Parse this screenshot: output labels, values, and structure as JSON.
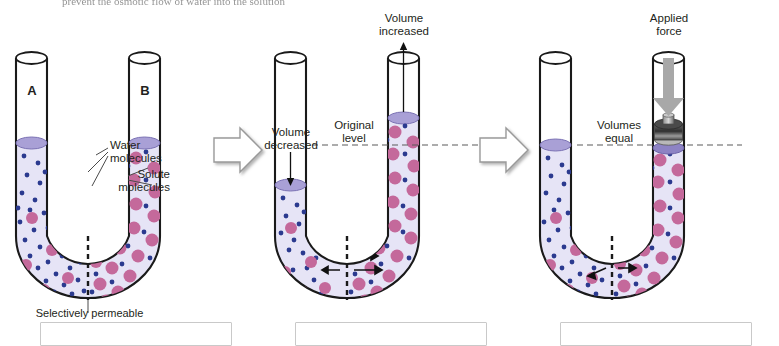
{
  "figure": {
    "clipped_header_text": "prevent the osmotic flow of water into the solution",
    "colors": {
      "fluid": "#e6e4f6",
      "surface": "#a9a0d6",
      "surface_dark": "#8d83c4",
      "solute": "#c4699b",
      "water": "#2b3a8f",
      "glass_outline": "#1a1a1a",
      "block_arrow_fill": "#ffffff",
      "block_arrow_stroke": "#9a9a9a",
      "weight_dark": "#3a3a3a",
      "weight_light": "#b8b8b8",
      "force_arrow": "#9c9c9c",
      "dash_line": "#5a5a5a"
    }
  },
  "panels": [
    {
      "id": "panel-initial",
      "tube_left_label": "A",
      "tube_right_label": "B",
      "annotations": [
        {
          "name": "water-molecules-label",
          "text": "Water\nmolecules"
        },
        {
          "name": "solute-molecules-label",
          "text": "Solute\nmolecules"
        },
        {
          "name": "membrane-label",
          "text": "Selectively permeable membrane"
        }
      ]
    },
    {
      "id": "panel-osmosis",
      "annotations": [
        {
          "name": "volume-decreased-label",
          "text": "Volume\ndecreased"
        },
        {
          "name": "original-level-label",
          "text": "Original\nlevel"
        },
        {
          "name": "volume-increased-label",
          "text": "Volume\nincreased"
        }
      ]
    },
    {
      "id": "panel-equilibrium",
      "annotations": [
        {
          "name": "volumes-equal-label",
          "text": "Volumes\nequal"
        },
        {
          "name": "applied-force-label",
          "text": "Applied\nforce"
        }
      ]
    }
  ],
  "captions": [
    "",
    "",
    ""
  ]
}
